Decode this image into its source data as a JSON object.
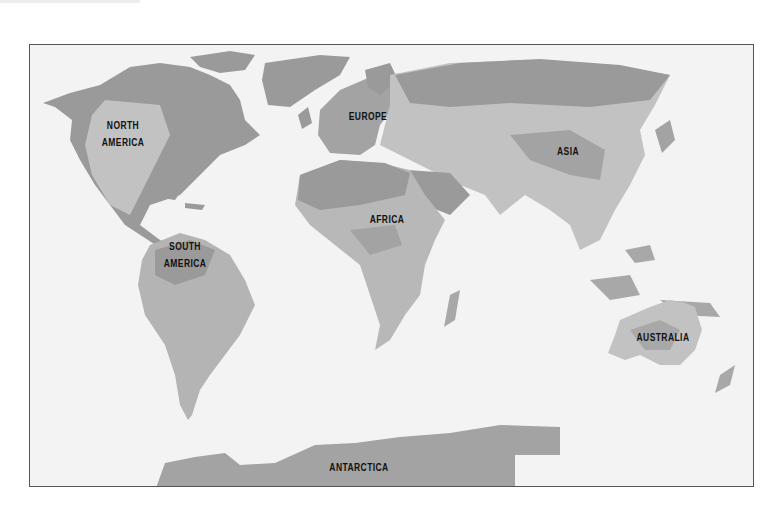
{
  "map": {
    "type": "world-climate-zones",
    "style": "grayscale",
    "colors": {
      "ocean": "#f3f3f3",
      "land_dark": "#9a9a9a",
      "land_mid": "#b1b1b1",
      "land_light": "#c6c6c6",
      "frame": "#555555",
      "label": "#111111"
    },
    "labels": {
      "north_america": "NORTH\nAMERICA",
      "south_america": "SOUTH\nAMERICA",
      "europe": "EUROPE",
      "africa": "AFRICA",
      "asia": "ASIA",
      "australia": "AUSTRALIA",
      "antarctica": "ANTARCTICA"
    }
  }
}
